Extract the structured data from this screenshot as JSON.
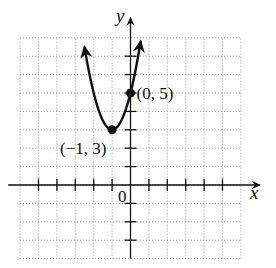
{
  "chart_data": {
    "type": "line",
    "title": "",
    "xlabel": "x",
    "ylabel": "y",
    "origin_label": "0",
    "xlim": [
      -6,
      6
    ],
    "ylim": [
      -4,
      8
    ],
    "grid": true,
    "x_ticks": [
      -5,
      -4,
      -3,
      -2,
      -1,
      1,
      2,
      3,
      4,
      5
    ],
    "y_ticks": [
      -3,
      -2,
      -1,
      1,
      2,
      3,
      4,
      5,
      6,
      7
    ],
    "series": [
      {
        "name": "parabola",
        "equation": "y = 2(x + 1)^2 + 3",
        "a": 2,
        "h": -1,
        "k": 3,
        "x_domain": [
          -2.5,
          0.55
        ],
        "arrows_both_ends": true
      }
    ],
    "points": [
      {
        "x": 0,
        "y": 5,
        "label": "(0, 5)",
        "label_position": "right"
      },
      {
        "x": -1,
        "y": 3,
        "label": "(−1, 3)",
        "label_position": "bottom-left"
      }
    ]
  }
}
